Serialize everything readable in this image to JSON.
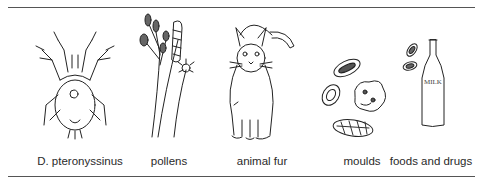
{
  "figure": {
    "items": [
      {
        "label": "D. pteronyssinus",
        "icon": "dust-mite-icon"
      },
      {
        "label": "pollens",
        "icon": "pollen-plants-icon"
      },
      {
        "label": "animal fur",
        "icon": "cat-icon"
      },
      {
        "label": "moulds",
        "icon": "mould-spores-icon"
      },
      {
        "label": "foods and drugs",
        "icon": "milk-bottle-icon"
      }
    ],
    "milk_bottle_text": "MILK"
  }
}
